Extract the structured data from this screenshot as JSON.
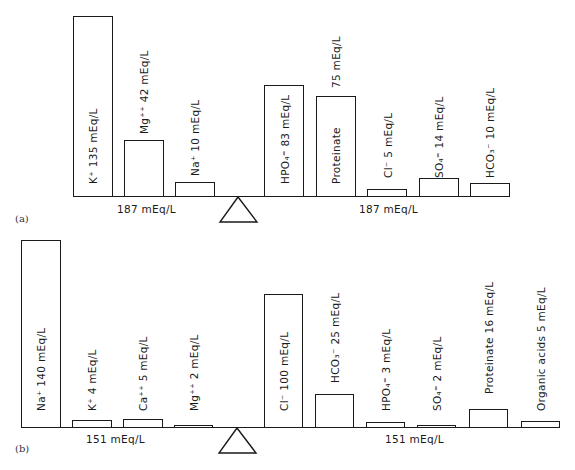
{
  "panels": [
    {
      "id": "a",
      "panel_label": "(a)",
      "left_total": "187 mEq/L",
      "right_total": "187 mEq/L",
      "cations": [
        {
          "ion": "K⁺",
          "label": "K⁺  135 mEq/L",
          "value": 135
        },
        {
          "ion": "Mg⁺⁺",
          "label": "Mg⁺⁺  42 mEq/L",
          "value": 42
        },
        {
          "ion": "Na⁺",
          "label": "Na⁺  10 mEq/L",
          "value": 10
        }
      ],
      "anions": [
        {
          "ion": "HPO₄⁼",
          "label": "HPO₄⁼ 83 mEq/L",
          "value": 83
        },
        {
          "ion": "Proteinate",
          "label": "Proteinate",
          "value_label": "75 mEq/L",
          "value": 75
        },
        {
          "ion": "Cl⁻",
          "label": "Cl⁻  5 mEq/L",
          "value": 5
        },
        {
          "ion": "SO₄⁼",
          "label": "SO₄⁼  14 mEq/L",
          "value": 14
        },
        {
          "ion": "HCO₃⁻",
          "label": "HCO₃⁻ 10 mEq/L",
          "value": 10
        }
      ]
    },
    {
      "id": "b",
      "panel_label": "(b)",
      "left_total": "151 mEq/L",
      "right_total": "151 mEq/L",
      "cations": [
        {
          "ion": "Na⁺",
          "label": "Na⁺  140 mEq/L",
          "value": 140
        },
        {
          "ion": "K⁺",
          "label": "K⁺    4 mEq/L",
          "value": 4
        },
        {
          "ion": "Ca⁺⁺",
          "label": "Ca⁺⁺ 5 mEq/L",
          "value": 5
        },
        {
          "ion": "Mg⁺⁺",
          "label": "Mg⁺⁺  2 mEq/L",
          "value": 2
        }
      ],
      "anions": [
        {
          "ion": "Cl⁻",
          "label": "Cl⁻   100 mEq/L",
          "value": 100
        },
        {
          "ion": "HCO₃⁻",
          "label": "HCO₃⁻  25 mEq/L",
          "value": 25
        },
        {
          "ion": "HPO₄⁼",
          "label": "HPO₄⁼   3 mEq/L",
          "value": 3
        },
        {
          "ion": "SO₄⁼",
          "label": "SO₄⁼   2 mEq/L",
          "value": 2
        },
        {
          "ion": "Proteinate",
          "label": "Proteinate  16 mEq/L",
          "value": 16
        },
        {
          "ion": "Organic acids",
          "label": "Organic acids  5 mEq/L",
          "value": 5
        }
      ]
    }
  ],
  "icons": {
    "fulcrum": "balance-triangle-icon"
  },
  "colors": {
    "line": "#1a1a1a",
    "background": "#ffffff"
  }
}
